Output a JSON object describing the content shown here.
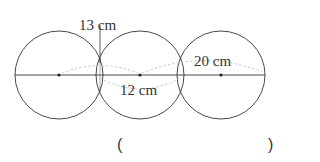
{
  "diagram": {
    "title_clipped": "",
    "circles": [
      {
        "cx": 59,
        "cy": 75,
        "r": 44
      },
      {
        "cx": 140,
        "cy": 75,
        "r": 44
      },
      {
        "cx": 221,
        "cy": 75,
        "r": 44
      }
    ],
    "line": {
      "x1": 15,
      "x2": 265,
      "y": 75
    },
    "labels": {
      "chord": "13 cm",
      "center_distance": "12 cm",
      "radius_span": "20 cm"
    },
    "answer": {
      "open_paren": "(",
      "close_paren": ")",
      "value": ""
    },
    "colors": {
      "stroke": "#333333",
      "dashed": "#c8c8c8",
      "text": "#333333"
    }
  }
}
